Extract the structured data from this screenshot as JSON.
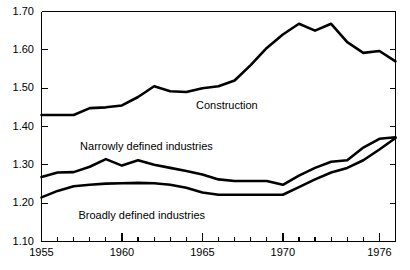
{
  "chart_data": {
    "type": "line",
    "title": "",
    "subtitle": "",
    "xlabel": "",
    "ylabel": "",
    "xlim": [
      1955,
      1977
    ],
    "ylim": [
      1.1,
      1.7
    ],
    "grid": false,
    "legend_position": "inline-annotations",
    "x": [
      1955,
      1956,
      1957,
      1958,
      1959,
      1960,
      1961,
      1962,
      1963,
      1964,
      1965,
      1966,
      1967,
      1968,
      1969,
      1970,
      1971,
      1972,
      1973,
      1974,
      1975,
      1976,
      1977
    ],
    "y_ticks": [
      1.1,
      1.2,
      1.3,
      1.4,
      1.5,
      1.6,
      1.7
    ],
    "y_tick_labels": [
      "1.10",
      "1.20",
      "1.30",
      "1.40",
      "1.50",
      "1.60",
      "1.70"
    ],
    "x_tick_major": [
      1955,
      1960,
      1965,
      1970,
      1976
    ],
    "x_tick_major_labels": [
      "1955",
      "1960",
      "1965",
      "1970",
      "1976"
    ],
    "x_tick_minor": [
      1956,
      1957,
      1958,
      1959,
      1961,
      1962,
      1963,
      1964,
      1966,
      1967,
      1968,
      1969,
      1971,
      1972,
      1973,
      1974,
      1975,
      1977
    ],
    "series": [
      {
        "name": "Construction",
        "label": "Construction",
        "color": "#000000",
        "values": [
          1.43,
          1.43,
          1.43,
          1.448,
          1.45,
          1.455,
          1.477,
          1.505,
          1.492,
          1.49,
          1.5,
          1.505,
          1.52,
          1.56,
          1.605,
          1.64,
          1.668,
          1.65,
          1.668,
          1.62,
          1.592,
          1.597,
          1.57
        ]
      },
      {
        "name": "Narrowly defined industries",
        "label": "Narrowly defined industries",
        "color": "#000000",
        "values": [
          1.268,
          1.28,
          1.281,
          1.295,
          1.315,
          1.298,
          1.312,
          1.3,
          1.292,
          1.284,
          1.275,
          1.262,
          1.258,
          1.258,
          1.258,
          1.248,
          1.272,
          1.292,
          1.308,
          1.312,
          1.345,
          1.368,
          1.372
        ]
      },
      {
        "name": "Broadly defined industries",
        "label": "Broadly defined industries",
        "color": "#000000",
        "values": [
          1.215,
          1.232,
          1.244,
          1.248,
          1.251,
          1.252,
          1.253,
          1.252,
          1.248,
          1.24,
          1.228,
          1.222,
          1.222,
          1.222,
          1.222,
          1.222,
          1.242,
          1.262,
          1.28,
          1.292,
          1.312,
          1.34,
          1.37
        ]
      }
    ],
    "annotations": [
      {
        "text": "Construction",
        "x": 1964.6,
        "y": 1.455
      },
      {
        "text": "Narrowly defined industries",
        "x": 1957.4,
        "y": 1.348
      },
      {
        "text": "Broadly defined industries",
        "x": 1957.3,
        "y": 1.168
      }
    ]
  }
}
